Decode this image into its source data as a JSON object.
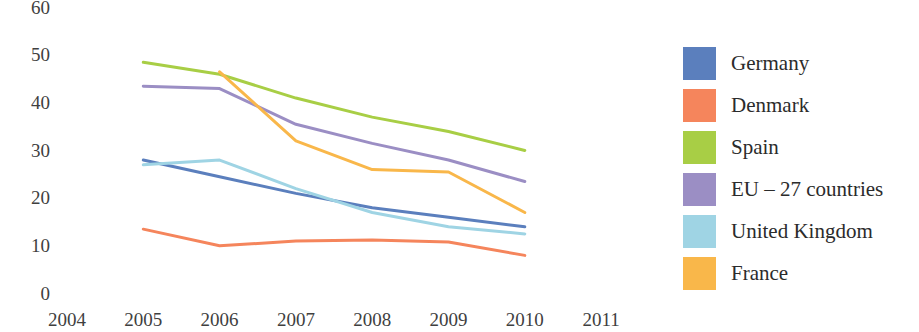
{
  "chart_data": {
    "type": "line",
    "title": "",
    "xlabel": "",
    "ylabel": "",
    "x": [
      2004,
      2005,
      2006,
      2007,
      2008,
      2009,
      2010,
      2011
    ],
    "xtick_labels": [
      "2004",
      "2005",
      "2006",
      "2007",
      "2008",
      "2009",
      "2010",
      "2011"
    ],
    "ytick_labels": [
      "0",
      "10",
      "20",
      "30",
      "40",
      "50",
      "60"
    ],
    "yticks": [
      0,
      10,
      20,
      30,
      40,
      50,
      60
    ],
    "ylim": [
      0,
      60
    ],
    "xlim": [
      2004,
      2011
    ],
    "grid": false,
    "legend_position": "right",
    "series": [
      {
        "name": "Germany",
        "color": "#5b7fbd",
        "x": [
          2005,
          2006,
          2007,
          2008,
          2009,
          2010
        ],
        "values": [
          28.0,
          24.5,
          21.0,
          18.0,
          16.0,
          14.0
        ]
      },
      {
        "name": "Denmark",
        "color": "#f5855c",
        "x": [
          2005,
          2006,
          2007,
          2008,
          2009,
          2010
        ],
        "values": [
          13.5,
          10.0,
          11.0,
          11.2,
          10.8,
          8.0
        ]
      },
      {
        "name": "Spain",
        "color": "#a8ce45",
        "x": [
          2005,
          2006,
          2007,
          2008,
          2009,
          2010
        ],
        "values": [
          48.5,
          46.0,
          41.0,
          37.0,
          34.0,
          30.0
        ]
      },
      {
        "name": "EU – 27 countries",
        "color": "#9b8ec4",
        "x": [
          2005,
          2006,
          2007,
          2008,
          2009,
          2010
        ],
        "values": [
          43.5,
          43.0,
          35.5,
          31.5,
          28.0,
          23.5
        ]
      },
      {
        "name": "United Kingdom",
        "color": "#9fd4e4",
        "x": [
          2005,
          2006,
          2007,
          2008,
          2009,
          2010
        ],
        "values": [
          27.0,
          28.0,
          22.0,
          17.0,
          14.0,
          12.5
        ]
      },
      {
        "name": "France",
        "color": "#f9b74a",
        "x": [
          2006,
          2007,
          2008,
          2009,
          2010
        ],
        "values": [
          46.5,
          32.0,
          26.0,
          25.5,
          17.0
        ]
      }
    ]
  },
  "legend": {
    "items": [
      {
        "label": "Germany",
        "color": "#5b7fbd"
      },
      {
        "label": "Denmark",
        "color": "#f5855c"
      },
      {
        "label": "Spain",
        "color": "#a8ce45"
      },
      {
        "label": "EU – 27 countries",
        "color": "#9b8ec4"
      },
      {
        "label": "United Kingdom",
        "color": "#9fd4e4"
      },
      {
        "label": "France",
        "color": "#f9b74a"
      }
    ]
  }
}
